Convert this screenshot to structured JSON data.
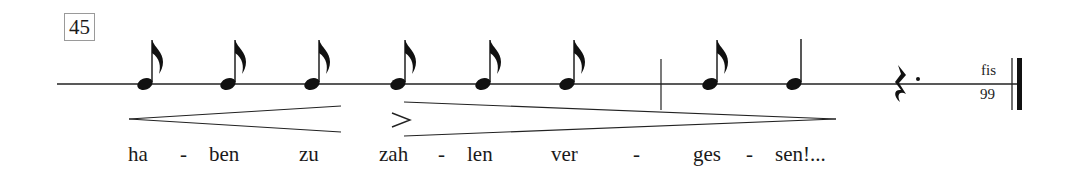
{
  "score": {
    "rehearsal_mark": "45",
    "notes": [
      {
        "type": "eighth",
        "x": 145,
        "syllable": "ha"
      },
      {
        "type": "eighth",
        "x": 228,
        "syllable": "ben"
      },
      {
        "type": "eighth",
        "x": 312,
        "syllable": "zu"
      },
      {
        "type": "eighth",
        "x": 398,
        "syllable": "zah",
        "accent": true
      },
      {
        "type": "eighth",
        "x": 483,
        "syllable": "len"
      },
      {
        "type": "eighth",
        "x": 567,
        "syllable": "ver"
      },
      {
        "type": "eighth",
        "x": 710,
        "syllable": "ges"
      },
      {
        "type": "quarter",
        "x": 794,
        "syllable": "sen!..."
      }
    ],
    "rest": {
      "type": "dotted-quarter-rest"
    },
    "barlines": [
      "single",
      "final-double"
    ],
    "dynamics": [
      {
        "type": "crescendo",
        "from_note": 1,
        "to_note": 3
      },
      {
        "type": "accent",
        "symbol": ">"
      },
      {
        "type": "decrescendo",
        "from_note": 4,
        "to_note": 8
      }
    ],
    "annotation": {
      "top": "fis",
      "bottom": "99"
    },
    "lyrics": [
      {
        "text": "ha",
        "x": 128
      },
      {
        "text": "-",
        "x": 180
      },
      {
        "text": "ben",
        "x": 209
      },
      {
        "text": "zu",
        "x": 299
      },
      {
        "text": "zah",
        "x": 379
      },
      {
        "text": "-",
        "x": 438
      },
      {
        "text": "len",
        "x": 467
      },
      {
        "text": "ver",
        "x": 551
      },
      {
        "text": "-",
        "x": 633
      },
      {
        "text": "ges",
        "x": 693
      },
      {
        "text": "-",
        "x": 746
      },
      {
        "text": "sen!...",
        "x": 775
      }
    ]
  }
}
